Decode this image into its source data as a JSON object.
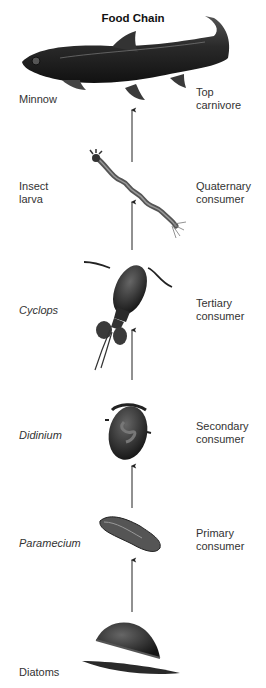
{
  "title": "Food Chain",
  "levels": [
    {
      "organism": "Minnow",
      "italic": false,
      "role_line1": "Top",
      "role_line2": "carnivore",
      "icon": "minnow-fish-icon"
    },
    {
      "organism_line1": "Insect",
      "organism_line2": "larva",
      "italic": false,
      "role_line1": "Quaternary",
      "role_line2": "consumer",
      "icon": "insect-larva-icon"
    },
    {
      "organism": "Cyclops",
      "italic": true,
      "role_line1": "Tertiary",
      "role_line2": "consumer",
      "icon": "cyclops-copepod-icon"
    },
    {
      "organism": "Didinium",
      "italic": true,
      "role_line1": "Secondary",
      "role_line2": "consumer",
      "icon": "didinium-icon"
    },
    {
      "organism": "Paramecium",
      "italic": true,
      "role_line1": "Primary",
      "role_line2": "consumer",
      "icon": "paramecium-icon"
    },
    {
      "organism": "Diatoms",
      "italic": false,
      "role_line1": "",
      "role_line2": "",
      "icon": "diatoms-icon"
    }
  ],
  "arrows": {
    "direction": "up",
    "count": 6,
    "color": "#222222"
  },
  "colors": {
    "background": "#ffffff",
    "organism": "#2a2a2a",
    "text": "#333333"
  }
}
